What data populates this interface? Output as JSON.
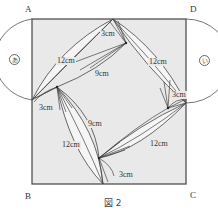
{
  "figure": {
    "caption": "図 2",
    "vertices": {
      "A": "A",
      "B": "B",
      "C": "C",
      "D": "D"
    },
    "regions": {
      "left": "あ",
      "right": "い"
    },
    "measurements": {
      "top_left_12": "12cm",
      "top_left_9": "9cm",
      "top_3": "3cm",
      "top_right_12": "12cm",
      "right_3": "3cm",
      "left_3": "3cm",
      "left_bottom_9": "9cm",
      "left_bottom_12": "12cm",
      "bottom_right_12": "12cm",
      "bottom_3": "3cm"
    },
    "colors": {
      "square_fill": "#e9e9e9",
      "line": "#444444",
      "background": "#ffffff"
    }
  }
}
